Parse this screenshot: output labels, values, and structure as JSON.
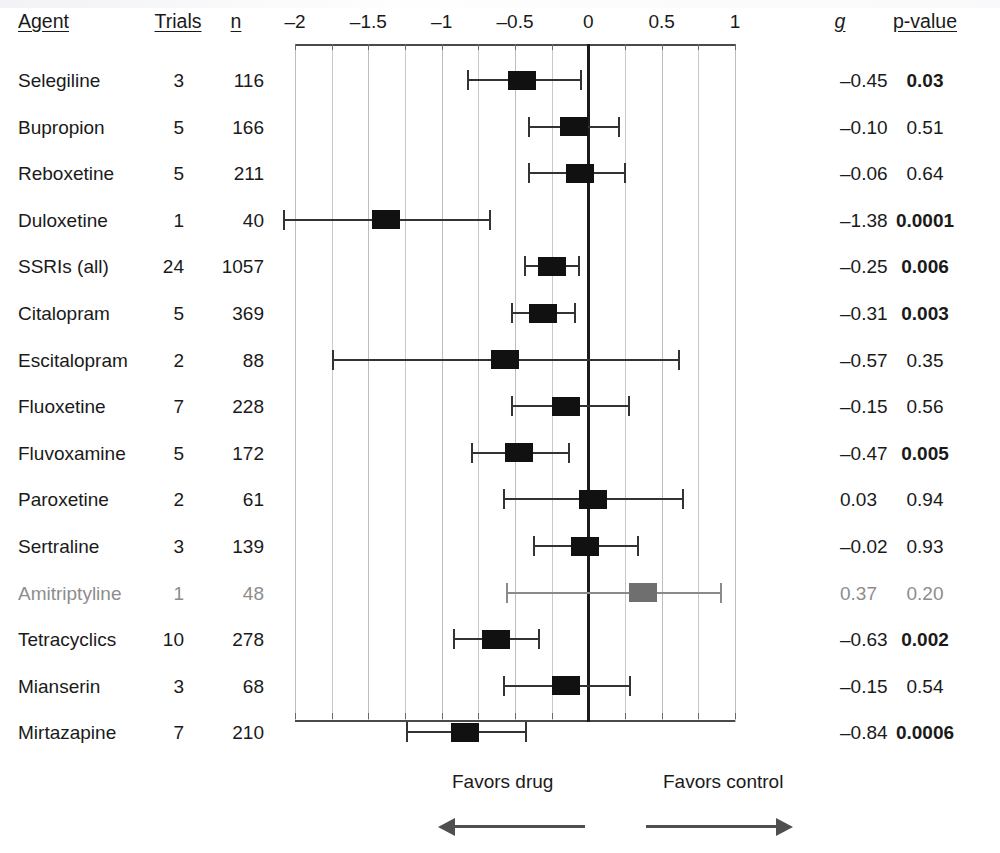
{
  "columns": {
    "agent": "Agent",
    "trials": "Trials",
    "n": "n",
    "g": "g",
    "pvalue": "p-value"
  },
  "footer": {
    "favors_left": "Favors drug",
    "favors_right": "Favors control",
    "left_arrow_icon": "arrow-left-icon",
    "right_arrow_icon": "arrow-right-icon"
  },
  "axis": {
    "ticks": [
      "–2",
      "–1.5",
      "–1",
      "–0.5",
      "0",
      "0.5",
      "1"
    ],
    "tick_values": [
      -2,
      -1.5,
      -1,
      -0.5,
      0,
      0.5,
      1
    ],
    "min": -2,
    "max": 1,
    "minor_step": 0.25,
    "zero_reference": 0
  },
  "rows": [
    {
      "agent": "Selegiline",
      "trials": "3",
      "n": "116",
      "g": "–0.45",
      "p": "0.03",
      "p_bold": true
    },
    {
      "agent": "Bupropion",
      "trials": "5",
      "n": "166",
      "g": "–0.10",
      "p": "0.51",
      "p_bold": false
    },
    {
      "agent": "Reboxetine",
      "trials": "5",
      "n": "211",
      "g": "–0.06",
      "p": "0.64",
      "p_bold": false
    },
    {
      "agent": "Duloxetine",
      "trials": "1",
      "n": "40",
      "g": "–1.38",
      "p": "0.0001",
      "p_bold": true
    },
    {
      "agent": "SSRIs (all)",
      "trials": "24",
      "n": "1057",
      "g": "–0.25",
      "p": "0.006",
      "p_bold": true
    },
    {
      "agent": "Citalopram",
      "trials": "5",
      "n": "369",
      "g": "–0.31",
      "p": "0.003",
      "p_bold": true
    },
    {
      "agent": "Escitalopram",
      "trials": "2",
      "n": "88",
      "g": "–0.57",
      "p": "0.35",
      "p_bold": false
    },
    {
      "agent": "Fluoxetine",
      "trials": "7",
      "n": "228",
      "g": "–0.15",
      "p": "0.56",
      "p_bold": false
    },
    {
      "agent": "Fluvoxamine",
      "trials": "5",
      "n": "172",
      "g": "–0.47",
      "p": "0.005",
      "p_bold": true
    },
    {
      "agent": "Paroxetine",
      "trials": "2",
      "n": "61",
      "g": "0.03",
      "p": "0.94",
      "p_bold": false
    },
    {
      "agent": "Sertraline",
      "trials": "3",
      "n": "139",
      "g": "–0.02",
      "p": "0.93",
      "p_bold": false
    },
    {
      "agent": "Amitriptyline",
      "trials": "1",
      "n": "48",
      "g": "0.37",
      "p": "0.20",
      "p_bold": false,
      "faded": true
    },
    {
      "agent": "Tetracyclics",
      "trials": "10",
      "n": "278",
      "g": "–0.63",
      "p": "0.002",
      "p_bold": true
    },
    {
      "agent": "Mianserin",
      "trials": "3",
      "n": "68",
      "g": "–0.15",
      "p": "0.54",
      "p_bold": false
    },
    {
      "agent": "Mirtazapine",
      "trials": "7",
      "n": "210",
      "g": "–0.84",
      "p": "0.0006",
      "p_bold": true
    }
  ],
  "chart_data": {
    "type": "forest",
    "title": "",
    "xlabel": "",
    "ylabel": "",
    "xlim": [
      -2,
      1
    ],
    "grid": true,
    "effect_measure": "Hedges' g",
    "null_value": 0,
    "categories": [
      "Selegiline",
      "Bupropion",
      "Reboxetine",
      "Duloxetine",
      "SSRIs (all)",
      "Citalopram",
      "Escitalopram",
      "Fluoxetine",
      "Fluvoxamine",
      "Paroxetine",
      "Sertraline",
      "Amitriptyline",
      "Tetracyclics",
      "Mianserin",
      "Mirtazapine"
    ],
    "points": [
      {
        "label": "Selegiline",
        "trials": 3,
        "n": 116,
        "g": -0.45,
        "ci_low": -0.83,
        "ci_high": -0.06,
        "p": 0.03,
        "significant": true
      },
      {
        "label": "Bupropion",
        "trials": 5,
        "n": 166,
        "g": -0.1,
        "ci_low": -0.41,
        "ci_high": 0.2,
        "p": 0.51,
        "significant": false
      },
      {
        "label": "Reboxetine",
        "trials": 5,
        "n": 211,
        "g": -0.06,
        "ci_low": -0.41,
        "ci_high": 0.24,
        "p": 0.64,
        "significant": false
      },
      {
        "label": "Duloxetine",
        "trials": 1,
        "n": 40,
        "g": -1.38,
        "ci_low": -2.08,
        "ci_high": -0.68,
        "p": 0.0001,
        "significant": true
      },
      {
        "label": "SSRIs (all)",
        "trials": 24,
        "n": 1057,
        "g": -0.25,
        "ci_low": -0.44,
        "ci_high": -0.07,
        "p": 0.006,
        "significant": true
      },
      {
        "label": "Citalopram",
        "trials": 5,
        "n": 369,
        "g": -0.31,
        "ci_low": -0.53,
        "ci_high": -0.1,
        "p": 0.003,
        "significant": true
      },
      {
        "label": "Escitalopram",
        "trials": 2,
        "n": 88,
        "g": -0.57,
        "ci_low": -1.75,
        "ci_high": 0.61,
        "p": 0.35,
        "significant": false
      },
      {
        "label": "Fluoxetine",
        "trials": 7,
        "n": 228,
        "g": -0.15,
        "ci_low": -0.53,
        "ci_high": 0.27,
        "p": 0.56,
        "significant": false
      },
      {
        "label": "Fluvoxamine",
        "trials": 5,
        "n": 172,
        "g": -0.47,
        "ci_low": -0.8,
        "ci_high": -0.14,
        "p": 0.005,
        "significant": true
      },
      {
        "label": "Paroxetine",
        "trials": 2,
        "n": 61,
        "g": 0.03,
        "ci_low": -0.58,
        "ci_high": 0.64,
        "p": 0.94,
        "significant": false
      },
      {
        "label": "Sertraline",
        "trials": 3,
        "n": 139,
        "g": -0.02,
        "ci_low": -0.38,
        "ci_high": 0.33,
        "p": 0.93,
        "significant": false
      },
      {
        "label": "Amitriptyline",
        "trials": 1,
        "n": 48,
        "g": 0.37,
        "ci_low": -0.56,
        "ci_high": 0.9,
        "p": 0.2,
        "significant": false
      },
      {
        "label": "Tetracyclics",
        "trials": 10,
        "n": 278,
        "g": -0.63,
        "ci_low": -0.92,
        "ci_high": -0.34,
        "p": 0.002,
        "significant": true
      },
      {
        "label": "Mianserin",
        "trials": 3,
        "n": 68,
        "g": -0.15,
        "ci_low": -0.58,
        "ci_high": 0.28,
        "p": 0.54,
        "significant": false
      },
      {
        "label": "Mirtazapine",
        "trials": 7,
        "n": 210,
        "g": -0.84,
        "ci_low": -1.24,
        "ci_high": -0.43,
        "p": 0.0006,
        "significant": true
      }
    ],
    "annotations": [
      "Favors drug",
      "Favors control"
    ]
  }
}
